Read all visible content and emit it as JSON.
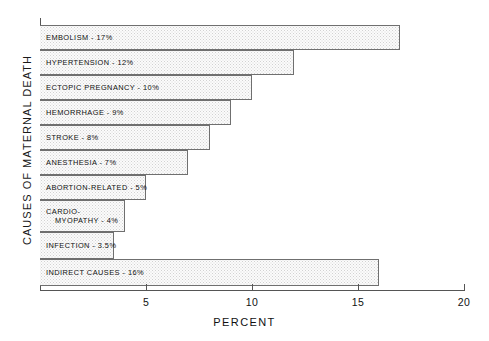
{
  "chart_data": {
    "type": "bar",
    "orientation": "horizontal",
    "title": "",
    "xlabel": "PERCENT",
    "ylabel": "CAUSES OF MATERNAL DEATH",
    "xlim": [
      0,
      20
    ],
    "ylim": null,
    "grid": false,
    "legend": null,
    "xticks": [
      5,
      10,
      15,
      20
    ],
    "xticklabels": [
      "5",
      "10",
      "15",
      "20"
    ],
    "categories": [
      "EMBOLISM",
      "HYPERTENSION",
      "ECTOPIC PREGNANCY",
      "HEMORRHAGE",
      "STROKE",
      "ANESTHESIA",
      "ABORTION-RELATED",
      "CARDIOMYOPATHY",
      "INFECTION",
      "INDIRECT CAUSES"
    ],
    "values": [
      17,
      12,
      10,
      9,
      8,
      7,
      5,
      4,
      3.5,
      16
    ],
    "bar_labels": [
      "EMBOLISM - 17%",
      "HYPERTENSION - 12%",
      "ECTOPIC PREGNANCY - 10%",
      "HEMORRHAGE - 9%",
      "STROKE -  8%",
      "ANESTHESIA - 7%",
      "ABORTION-RELATED -  5%",
      "CARDIO-",
      "INFECTION - 3.5%",
      "INDIRECT CAUSES - 16%"
    ],
    "bar_label_second_line": "MYOPATHY - 4%",
    "colors": {
      "bar_fill": "#fbfbfb",
      "bar_edge": "#6f6f6f",
      "axis": "#555555",
      "text": "#111111",
      "background": "#ffffff"
    }
  },
  "bars": [
    {
      "label": "EMBOLISM - 17%",
      "line2": "",
      "value": 17,
      "top": 0,
      "height": 25
    },
    {
      "label": "HYPERTENSION - 12%",
      "line2": "",
      "value": 12,
      "top": 25,
      "height": 25
    },
    {
      "label": "ECTOPIC PREGNANCY - 10%",
      "line2": "",
      "value": 10,
      "top": 50,
      "height": 25
    },
    {
      "label": "HEMORRHAGE - 9%",
      "line2": "",
      "value": 9,
      "top": 75,
      "height": 25
    },
    {
      "label": "STROKE -  8%",
      "line2": "",
      "value": 8,
      "top": 100,
      "height": 25
    },
    {
      "label": "ANESTHESIA - 7%",
      "line2": "",
      "value": 7,
      "top": 125,
      "height": 25
    },
    {
      "label": "ABORTION-RELATED -  5%",
      "line2": "",
      "value": 5,
      "top": 150,
      "height": 25
    },
    {
      "label": "CARDIO-",
      "line2": "MYOPATHY - 4%",
      "value": 4,
      "top": 175,
      "height": 32
    },
    {
      "label": "INFECTION - 3.5%",
      "line2": "",
      "value": 3.5,
      "top": 207,
      "height": 27
    },
    {
      "label": "INDIRECT CAUSES - 16%",
      "line2": "",
      "value": 16,
      "top": 234,
      "height": 27
    }
  ],
  "axis": {
    "x_title": "PERCENT",
    "y_title": "CAUSES OF MATERNAL DEATH",
    "ticks": [
      {
        "label": "5",
        "value": 5
      },
      {
        "label": "10",
        "value": 10
      },
      {
        "label": "15",
        "value": 15
      },
      {
        "label": "20",
        "value": 20
      }
    ]
  }
}
